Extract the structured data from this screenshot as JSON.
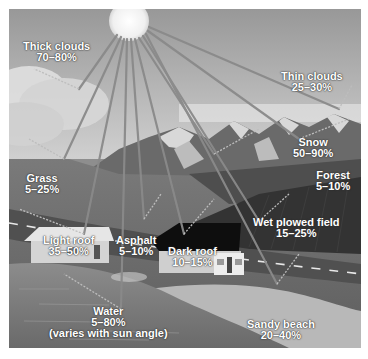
{
  "diagram": {
    "colors": {
      "sky_top": "#9a9a9a",
      "sky_bottom": "#c8c8c8",
      "sun": "#f4f4f4",
      "ray": "#7a7a7a",
      "ground": "#6e6e6e",
      "field": "#3a3a3a",
      "water": "#8a8a8a",
      "beach": "#bdbdbd"
    },
    "labels": [
      {
        "id": "thick-clouds",
        "name": "Thick clouds",
        "value": "70–80%"
      },
      {
        "id": "thin-clouds",
        "name": "Thin clouds",
        "value": "25–30%"
      },
      {
        "id": "snow",
        "name": "Snow",
        "value": "50–90%"
      },
      {
        "id": "forest",
        "name": "Forest",
        "value": "5–10%"
      },
      {
        "id": "grass",
        "name": "Grass",
        "value": "5–25%"
      },
      {
        "id": "wet-plowed-field",
        "name": "Wet plowed field",
        "value": "15–25%"
      },
      {
        "id": "light-roof",
        "name": "Light roof",
        "value": "35–50%"
      },
      {
        "id": "asphalt",
        "name": "Asphalt",
        "value": "5–10%"
      },
      {
        "id": "dark-roof",
        "name": "Dark roof",
        "value": "10–15%"
      },
      {
        "id": "water",
        "name": "Water",
        "value": "5–80%",
        "note": "(varies with sun angle)"
      },
      {
        "id": "sandy-beach",
        "name": "Sandy beach",
        "value": "20–40%"
      }
    ]
  }
}
